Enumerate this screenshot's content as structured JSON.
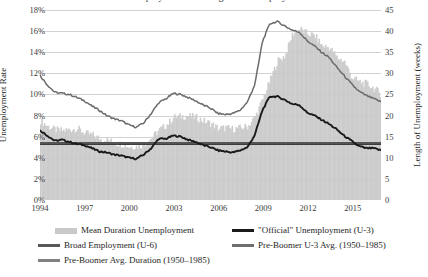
{
  "title": "Unemployment and Length of Unemployment",
  "axes": {
    "left_title": "Unemployment Rate",
    "right_title": "Length of Unemployment (weeks)",
    "left_ticks": [
      "0%",
      "2%",
      "4%",
      "6%",
      "8%",
      "10%",
      "12%",
      "14%",
      "16%",
      "18%"
    ],
    "right_ticks": [
      "0",
      "5",
      "10",
      "15",
      "20",
      "25",
      "30",
      "35",
      "40",
      "45"
    ],
    "x_ticks": [
      "1994",
      "1997",
      "2000",
      "2003",
      "2006",
      "2009",
      "2012",
      "2015"
    ]
  },
  "legend": {
    "items": [
      {
        "label": "Mean Duration Unemployment",
        "swatch": "bar",
        "color": "#c9c9c9"
      },
      {
        "label": "\"Official\" Unemployment (U-3)",
        "swatch": "line",
        "color": "#1a1a1a"
      },
      {
        "label": "Broad Employment (U-6)",
        "swatch": "line",
        "color": "#595959"
      },
      {
        "label": "Pre-Boomer U-3 Avg. (1950–1985)",
        "swatch": "line",
        "color": "#6e6e6e"
      },
      {
        "label": "Pre-Boomer Avg. Duration (1950–1985)",
        "swatch": "line",
        "color": "#808080"
      }
    ]
  },
  "colors": {
    "duration_area": "#c9c9c9",
    "u3_line": "#1a1a1a",
    "u6_line": "#6b6b6b",
    "u3_avg_line": "#3d3d3d",
    "duration_avg_line": "#555555",
    "gridline": "#d2d2d2",
    "text": "#262626"
  },
  "chart_data": {
    "type": "line",
    "title": "Unemployment and Length of Unemployment",
    "xlabel": "",
    "ylabel": "Unemployment Rate",
    "y2label": "Length of Unemployment (weeks)",
    "ylim": [
      0,
      18
    ],
    "y2lim": [
      0,
      45
    ],
    "xlim": [
      1994.0,
      2016.9
    ],
    "grid": true,
    "legend_position": "bottom",
    "reference_lines": [
      {
        "name": "Pre-Boomer U-3 Avg. (1950–1985)",
        "axis": "left",
        "value": 5.3,
        "color": "#3d3d3d"
      },
      {
        "name": "Pre-Boomer Avg. Duration (1950–1985)",
        "axis": "right",
        "value": 13.5,
        "color": "#555555"
      }
    ],
    "x": [
      1994.0,
      1994.5,
      1995.0,
      1995.5,
      1996.0,
      1996.5,
      1997.0,
      1997.5,
      1998.0,
      1998.5,
      1999.0,
      1999.5,
      2000.0,
      2000.5,
      2001.0,
      2001.5,
      2002.0,
      2002.5,
      2003.0,
      2003.5,
      2004.0,
      2004.5,
      2005.0,
      2005.5,
      2006.0,
      2006.5,
      2007.0,
      2007.5,
      2008.0,
      2008.5,
      2009.0,
      2009.5,
      2010.0,
      2010.5,
      2011.0,
      2011.5,
      2012.0,
      2012.5,
      2013.0,
      2013.5,
      2014.0,
      2014.5,
      2015.0,
      2015.5,
      2016.0,
      2016.5,
      2016.9
    ],
    "series": [
      {
        "name": "Broad Employment (U-6)",
        "axis": "left",
        "unit": "%",
        "color": "#6b6b6b",
        "values": [
          11.8,
          10.9,
          10.2,
          10.1,
          10.0,
          9.7,
          9.4,
          8.9,
          8.5,
          8.0,
          7.7,
          7.5,
          7.1,
          6.9,
          7.3,
          8.2,
          9.2,
          9.6,
          10.1,
          10.0,
          9.7,
          9.4,
          9.0,
          8.7,
          8.2,
          8.1,
          8.2,
          8.5,
          9.3,
          11.0,
          15.0,
          16.7,
          16.9,
          16.5,
          16.1,
          15.9,
          15.1,
          14.6,
          14.0,
          13.5,
          12.6,
          11.8,
          11.0,
          10.3,
          9.9,
          9.6,
          9.3
        ]
      },
      {
        "name": "\"Official\" Unemployment (U-3)",
        "axis": "left",
        "unit": "%",
        "color": "#1a1a1a",
        "values": [
          6.6,
          6.1,
          5.6,
          5.7,
          5.5,
          5.3,
          5.2,
          4.9,
          4.6,
          4.5,
          4.3,
          4.2,
          4.0,
          3.9,
          4.3,
          4.9,
          5.8,
          5.8,
          6.1,
          6.0,
          5.7,
          5.5,
          5.2,
          5.0,
          4.7,
          4.6,
          4.5,
          4.7,
          5.0,
          6.2,
          8.5,
          9.8,
          9.8,
          9.5,
          9.1,
          9.0,
          8.3,
          8.0,
          7.6,
          7.2,
          6.7,
          6.1,
          5.6,
          5.1,
          4.9,
          4.9,
          4.7
        ]
      },
      {
        "name": "Mean Duration Unemployment",
        "axis": "right",
        "unit": "weeks",
        "color": "#c9c9c9",
        "values": [
          18.8,
          17.4,
          16.6,
          16.4,
          16.7,
          16.9,
          15.8,
          15.4,
          14.5,
          14.2,
          13.5,
          13.2,
          12.6,
          12.7,
          13.2,
          14.8,
          16.6,
          17.8,
          19.6,
          19.8,
          19.9,
          19.5,
          18.7,
          18.1,
          16.9,
          17.1,
          16.8,
          17.1,
          17.5,
          19.9,
          24.0,
          28.6,
          33.0,
          34.2,
          39.4,
          40.5,
          39.4,
          38.9,
          36.5,
          36.1,
          33.7,
          32.8,
          29.0,
          28.0,
          27.5,
          26.4,
          25.0
        ]
      }
    ]
  }
}
